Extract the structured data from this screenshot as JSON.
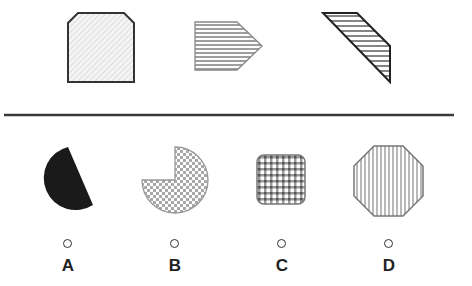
{
  "puzzle": {
    "question_shapes": [
      {
        "id": "q1",
        "shape": "chamfered-square",
        "pattern": "diagonal-light-hatch"
      },
      {
        "id": "q2",
        "shape": "pentagon-arrow-right",
        "pattern": "horizontal-stripes"
      },
      {
        "id": "q3",
        "shape": "slanted-quadrilateral",
        "pattern": "horizontal-stripes"
      }
    ],
    "options": [
      {
        "label": "A",
        "shape": "circle-segment",
        "pattern": "solid-black"
      },
      {
        "label": "B",
        "shape": "three-quarter-circle",
        "pattern": "checkerboard"
      },
      {
        "label": "C",
        "shape": "rounded-square",
        "pattern": "grid-check"
      },
      {
        "label": "D",
        "shape": "octagon",
        "pattern": "vertical-stripes"
      }
    ]
  },
  "colors": {
    "outline": "#333333",
    "divider": "#3a3a3a",
    "fill_black": "#1a1a1a",
    "pattern_gray": "#9a9a9a"
  }
}
